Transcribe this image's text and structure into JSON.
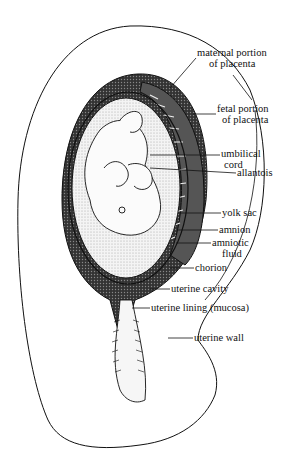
{
  "diagram": {
    "labels": [
      {
        "id": "maternal-placenta",
        "line1": "maternal portion",
        "line2": "of placenta",
        "x": 197,
        "y": 47
      },
      {
        "id": "fetal-placenta",
        "line1": "fetal portion",
        "line2": "of placenta",
        "x": 217,
        "y": 103
      },
      {
        "id": "umbilical-cord",
        "line1": "umbilical",
        "line2": "cord",
        "x": 221,
        "y": 148
      },
      {
        "id": "allantois",
        "line1": "allantois",
        "line2": "",
        "x": 237,
        "y": 167
      },
      {
        "id": "yolk-sac",
        "line1": "yolk sac",
        "line2": "",
        "x": 222,
        "y": 207
      },
      {
        "id": "amnion",
        "line1": "amnion",
        "line2": "",
        "x": 219,
        "y": 224
      },
      {
        "id": "amniotic-fluid",
        "line1": "amniotic",
        "line2": "fluid",
        "x": 212,
        "y": 237
      },
      {
        "id": "chorion",
        "line1": "chorion",
        "line2": "",
        "x": 195,
        "y": 262
      },
      {
        "id": "uterine-cavity",
        "line1": "uterine cavity",
        "line2": "",
        "x": 171,
        "y": 283
      },
      {
        "id": "uterine-lining",
        "line1": "uterine lining (mucosa)",
        "line2": "",
        "x": 151,
        "y": 302
      },
      {
        "id": "uterine-wall",
        "line1": "uterine wall",
        "line2": "",
        "x": 194,
        "y": 332
      }
    ],
    "colors": {
      "ink": "#111111",
      "paper": "#ffffff",
      "stipple": "#c8c8c8",
      "dark_tissue": "#2a2a2a"
    }
  }
}
